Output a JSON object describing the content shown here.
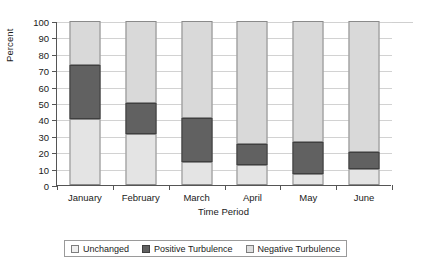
{
  "chart_data": {
    "type": "bar",
    "stacked": true,
    "title": "",
    "xlabel": "Time Period",
    "ylabel": "Percent",
    "ylim": [
      0,
      100
    ],
    "yticks": [
      0,
      10,
      20,
      30,
      40,
      50,
      60,
      70,
      80,
      90,
      100
    ],
    "grid": true,
    "legend_position": "bottom",
    "categories": [
      "January",
      "February",
      "March",
      "April",
      "May",
      "June"
    ],
    "series": [
      {
        "name": "Unchanged",
        "color": "#e4e4e4",
        "values": [
          40,
          31,
          14,
          12.5,
          7,
          10
        ]
      },
      {
        "name": "Positive Turbulence",
        "color": "#616161",
        "values": [
          33,
          19,
          27,
          12.5,
          19,
          10
        ]
      },
      {
        "name": "Negative Turbulence",
        "color": "#d9d9d9",
        "values": [
          27,
          50,
          59,
          75,
          74,
          80
        ]
      }
    ],
    "cumulative_tops": {
      "January": [
        40,
        73,
        100
      ],
      "February": [
        31,
        50,
        100
      ],
      "March": [
        14,
        41,
        100
      ],
      "April": [
        12.5,
        25,
        100
      ],
      "May": [
        7,
        26,
        100
      ],
      "June": [
        10,
        20,
        100
      ]
    }
  },
  "axes": {
    "y_title": "Percent",
    "x_title": "Time Period",
    "y_tick_labels": [
      "0",
      "10",
      "20",
      "30",
      "40",
      "50",
      "60",
      "70",
      "80",
      "90",
      "100"
    ],
    "x_tick_labels": [
      "January",
      "February",
      "March",
      "April",
      "May",
      "June"
    ]
  },
  "legend": {
    "items": [
      {
        "label": "Unchanged",
        "swatch": "light-gray-swatch"
      },
      {
        "label": "Positive Turbulence",
        "swatch": "dark-gray-swatch"
      },
      {
        "label": "Negative Turbulence",
        "swatch": "pale-gray-swatch"
      }
    ]
  }
}
